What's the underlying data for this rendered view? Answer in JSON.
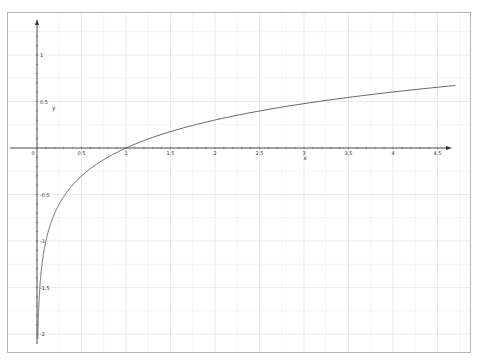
{
  "chart_data": {
    "type": "line",
    "title": "",
    "xlabel": "x",
    "ylabel": "y",
    "function": "y = log10(x)",
    "xlim": [
      0,
      4.7
    ],
    "ylim": [
      -2.1,
      1.35
    ],
    "grid": true,
    "legend": null,
    "x_ticks": [
      "0",
      "0.5",
      "1",
      "1.5",
      "2",
      "2.5",
      "3",
      "3.5",
      "4",
      "4.5"
    ],
    "y_ticks": [
      "1",
      "0.5",
      "-0.5",
      "-1",
      "-1.5",
      "-2"
    ],
    "series": [
      {
        "name": "log10(x)",
        "x": [
          0.009,
          0.01,
          0.02,
          0.05,
          0.1,
          0.2,
          0.3,
          0.5,
          0.75,
          1,
          1.5,
          2,
          2.5,
          3,
          3.5,
          4,
          4.5,
          4.7
        ],
        "values": [
          -2.05,
          -2,
          -1.7,
          -1.3,
          -1,
          -0.7,
          -0.52,
          -0.3,
          -0.125,
          0,
          0.176,
          0.301,
          0.398,
          0.477,
          0.544,
          0.602,
          0.653,
          0.672
        ]
      }
    ],
    "line_color": "#555555"
  },
  "axes": {
    "x_name": "x",
    "y_name": "y",
    "origin_label": "0"
  }
}
